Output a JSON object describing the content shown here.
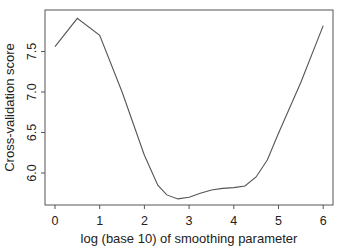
{
  "chart_data": {
    "type": "line",
    "title": "",
    "xlabel": "log (base 10) of smoothing parameter",
    "ylabel": "Cross-validation score",
    "xlim": [
      -0.25,
      6.25
    ],
    "ylim": [
      5.6,
      8.0
    ],
    "xticks": [
      0,
      1,
      2,
      3,
      4,
      5,
      6
    ],
    "xtick_labels": [
      "0",
      "1",
      "2",
      "3",
      "4",
      "5",
      "6"
    ],
    "yticks": [
      6.0,
      6.5,
      7.0,
      7.5
    ],
    "ytick_labels": [
      "6.0",
      "6.5",
      "7.0",
      "7.5"
    ],
    "grid": false,
    "legend": null,
    "series": [
      {
        "name": "CV score",
        "color": "#555555",
        "x": [
          0,
          0.5,
          1.0,
          1.5,
          2.0,
          2.3,
          2.5,
          2.75,
          3.0,
          3.25,
          3.5,
          3.75,
          4.0,
          4.25,
          4.5,
          4.75,
          5.0,
          5.5,
          6.0
        ],
        "y": [
          7.56,
          7.91,
          7.7,
          7.0,
          6.22,
          5.85,
          5.73,
          5.68,
          5.7,
          5.75,
          5.79,
          5.81,
          5.82,
          5.84,
          5.95,
          6.16,
          6.49,
          7.12,
          7.82
        ]
      }
    ]
  }
}
